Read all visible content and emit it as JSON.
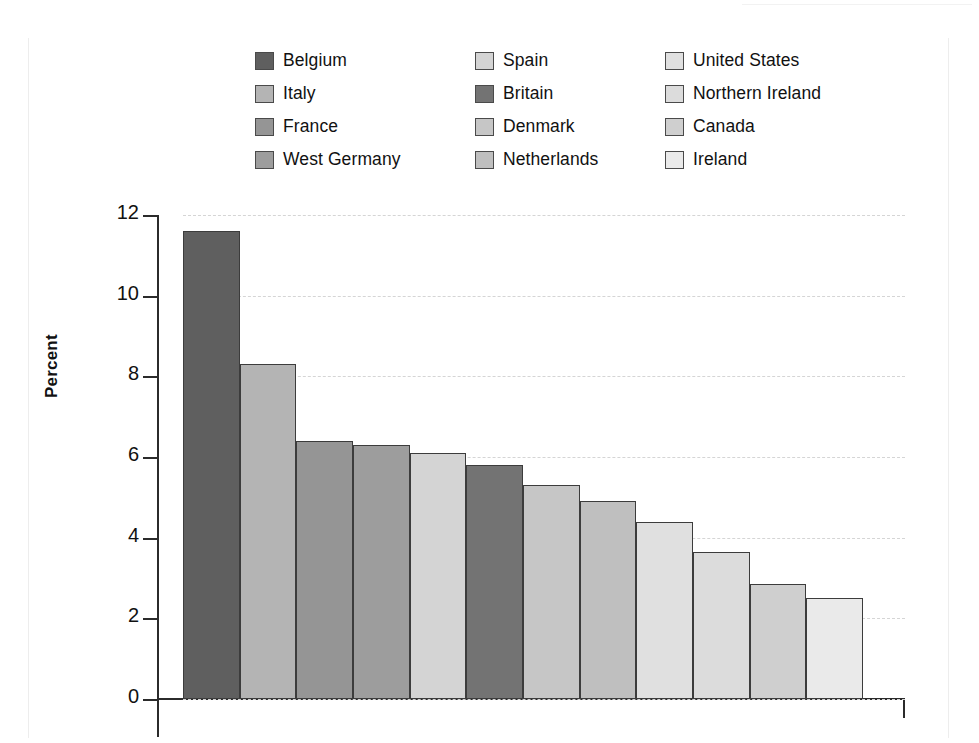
{
  "chart_data": {
    "type": "bar",
    "title": "",
    "subtitle": "",
    "xlabel": "",
    "ylabel": "Percent",
    "ylim": [
      0,
      12
    ],
    "ytick_labels": [
      "12",
      "10",
      "8",
      "6",
      "4",
      "2",
      "0"
    ],
    "ytick_values": [
      12,
      10,
      8,
      6,
      4,
      2,
      0
    ],
    "grid": true,
    "grid_axis": "y",
    "grid_style": "dashed",
    "legend_position": "top",
    "legend_columns": 3,
    "categories": [
      "Belgium",
      "Italy",
      "France",
      "West Germany",
      "Spain",
      "Britain",
      "Denmark",
      "Netherlands",
      "United States",
      "Northern Ireland",
      "Canada",
      "Ireland"
    ],
    "values": [
      11.6,
      8.3,
      6.4,
      6.3,
      6.1,
      5.8,
      5.3,
      4.9,
      4.4,
      3.65,
      2.85,
      2.5
    ],
    "colors": [
      "#5f5f5f",
      "#b4b4b4",
      "#959595",
      "#9d9d9d",
      "#d4d4d4",
      "#737373",
      "#c6c6c6",
      "#bfbfbf",
      "#e0e0e0",
      "#dcdcdc",
      "#cfcfcf",
      "#eaeaea"
    ],
    "bar_edge_color": "#3c3c3c",
    "axis_color": "#2b2b2b",
    "gridline_color": "#d5d5d5"
  },
  "legend": {
    "columns": [
      [
        {
          "label": "Belgium",
          "color": "#5f5f5f"
        },
        {
          "label": "Italy",
          "color": "#b4b4b4"
        },
        {
          "label": "France",
          "color": "#959595"
        },
        {
          "label": "West Germany",
          "color": "#9d9d9d"
        }
      ],
      [
        {
          "label": "Spain",
          "color": "#d4d4d4"
        },
        {
          "label": "Britain",
          "color": "#737373"
        },
        {
          "label": "Denmark",
          "color": "#c6c6c6"
        },
        {
          "label": "Netherlands",
          "color": "#bfbfbf"
        }
      ],
      [
        {
          "label": "United States",
          "color": "#e0e0e0"
        },
        {
          "label": "Northern Ireland",
          "color": "#dcdcdc"
        },
        {
          "label": "Canada",
          "color": "#cfcfcf"
        },
        {
          "label": "Ireland",
          "color": "#eaeaea"
        }
      ]
    ]
  }
}
